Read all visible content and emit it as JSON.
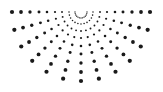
{
  "graphic": {
    "name": "half-sunburst-dot-pattern",
    "background": "#ffffff",
    "dot_color": "#1a1a1a",
    "center": [
      81,
      12
    ],
    "ray_angles_deg": [
      0,
      15,
      30,
      45,
      60,
      75,
      90,
      105,
      120,
      135,
      150,
      165,
      180
    ],
    "radii": [
      6,
      12,
      19,
      26,
      34,
      42,
      51,
      60,
      69
    ],
    "dot_min_r": 0.5,
    "dot_max_r": 2.1
  }
}
